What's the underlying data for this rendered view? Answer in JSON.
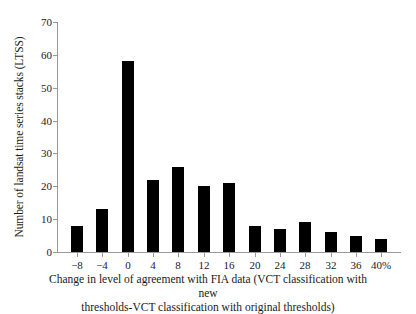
{
  "chart_data": {
    "type": "bar",
    "title": "",
    "subtitle": "",
    "xlabel": "Change in level of agreement with FIA data (VCT classification with new thresholds-VCT classification with original thresholds)",
    "ylabel": "Number of landsat time series stacks (LTSS)",
    "categories": [
      "−8",
      "−4",
      "0",
      "4",
      "8",
      "12",
      "16",
      "20",
      "24",
      "28",
      "32",
      "36",
      "40%"
    ],
    "values": [
      8,
      13,
      58,
      22,
      26,
      20,
      21,
      8,
      7,
      9,
      6,
      5,
      4
    ],
    "ylim": [
      0,
      70
    ],
    "y_ticks": [
      0,
      10,
      20,
      30,
      40,
      50,
      60,
      70
    ],
    "y_tick_labels": [
      "0",
      "10",
      "20",
      "30",
      "40",
      "50",
      "60",
      "70"
    ],
    "grid": false,
    "legend": false,
    "legend_position": "none",
    "bar_color": "#000000",
    "axis_color": "#9a9a9a",
    "text_color": "#1a1a1a",
    "background_color": "#ffffff"
  },
  "axis_caption": {
    "line1": "Change in level of agreement with FIA data (VCT classification with new",
    "line2": "thresholds-VCT classification with original thresholds)"
  }
}
